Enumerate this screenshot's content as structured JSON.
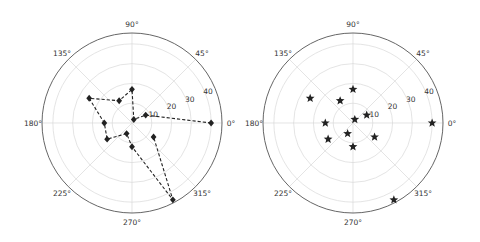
{
  "chart_data": [
    {
      "type": "line",
      "projection": "polar",
      "title": "",
      "marker": "diamond",
      "linestyle": "dashed",
      "color": "#222222",
      "theta_deg": [
        0,
        30,
        63,
        90,
        120,
        150,
        180,
        213,
        243,
        270,
        298,
        327
      ],
      "r": [
        40,
        8,
        2,
        17,
        13,
        25,
        14,
        15,
        6,
        12,
        44,
        13
      ],
      "angle_tick_labels": [
        "0°",
        "45°",
        "90°",
        "135°",
        "180°",
        "225°",
        "270°",
        "315°"
      ],
      "radial_tick_labels": [
        "10",
        "20",
        "30",
        "40"
      ],
      "rlim": [
        0,
        45.5
      ],
      "grid": true
    },
    {
      "type": "scatter",
      "projection": "polar",
      "title": "",
      "marker": "star",
      "color": "#222222",
      "theta_deg": [
        0,
        30,
        63,
        90,
        120,
        150,
        180,
        213,
        243,
        270,
        298,
        327
      ],
      "r": [
        40,
        8,
        2,
        17,
        13,
        25,
        14,
        15,
        6,
        12,
        44,
        13
      ],
      "angle_tick_labels": [
        "0°",
        "45°",
        "90°",
        "135°",
        "180°",
        "225°",
        "270°",
        "315°"
      ],
      "radial_tick_labels": [
        "10",
        "20",
        "30",
        "40"
      ],
      "rlim": [
        0,
        45.5
      ],
      "grid": true
    }
  ],
  "layout": {
    "axes": [
      {
        "cx": 132,
        "cy": 123,
        "radius": 90
      },
      {
        "cx": 353,
        "cy": 123,
        "radius": 90
      }
    ],
    "label_angle_deg": 22.5
  }
}
